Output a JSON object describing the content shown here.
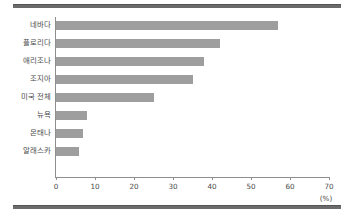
{
  "chart_data": {
    "type": "bar",
    "orientation": "horizontal",
    "title": "",
    "xlabel": "(%)",
    "ylabel": "",
    "xlim": [
      0,
      70
    ],
    "xticks": [
      "0",
      "10",
      "20",
      "30",
      "40",
      "50",
      "60",
      "70"
    ],
    "grid": false,
    "legend": null,
    "bar_color": "#9e9e9e",
    "axis_color": "#8e8e8e",
    "rule_color": "#6b6b6b",
    "categories": [
      "네바다",
      "플로리다",
      "애리조나",
      "조지아",
      "미국 전체",
      "뉴욕",
      "몬태나",
      "알래스카"
    ],
    "values": [
      57,
      42,
      38,
      35,
      25,
      8,
      7,
      6
    ]
  }
}
